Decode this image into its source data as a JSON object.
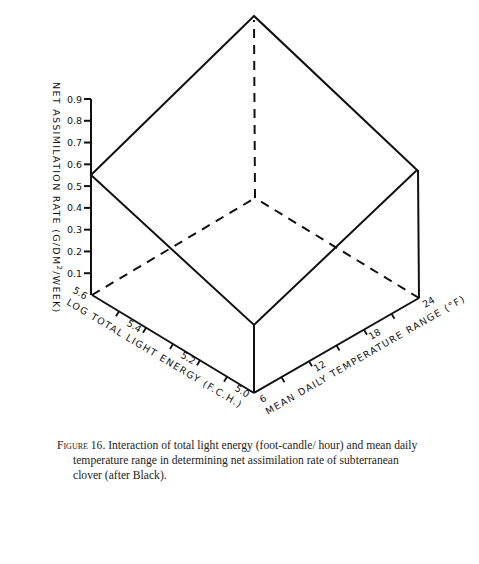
{
  "chart_data": {
    "type": "3d-surface-diagram",
    "title": "",
    "axes": {
      "z": {
        "label": "NET ASSIMILATION RATE (G/DM2/WEEK)",
        "label_parts": [
          "NET ASSIMILATION RATE (G/DM",
          "2",
          "/WEEK)"
        ],
        "ticks": [
          "0.1",
          "0.2",
          "0.3",
          "0.4",
          "0.5",
          "0.6",
          "0.7",
          "0.8",
          "0.9"
        ],
        "range": [
          0,
          0.9
        ]
      },
      "x": {
        "label": "LOG TOTAL LIGHT ENERGY (F.C.H.)",
        "tick_labels": [
          "5.6",
          "5.4",
          "5.2",
          "5.0"
        ],
        "tick_values": [
          5.6,
          5.5,
          5.4,
          5.3,
          5.2,
          5.1,
          5.0
        ],
        "range": [
          5.0,
          5.6
        ]
      },
      "y": {
        "label": "MEAN DAILY TEMPERATURE RANGE (°F)",
        "tick_labels": [
          "6",
          "12",
          "18",
          "24"
        ],
        "tick_values": [
          6,
          9,
          12,
          15,
          18,
          21,
          24
        ],
        "range": [
          6,
          24
        ]
      }
    },
    "surface_corners": [
      {
        "light": 5.6,
        "temp_range": 6,
        "nar": 0.55
      },
      {
        "light": 5.0,
        "temp_range": 6,
        "nar": 0.31
      },
      {
        "light": 5.0,
        "temp_range": 24,
        "nar": 0.59
      },
      {
        "light": 5.6,
        "temp_range": 24,
        "nar": 0.84
      }
    ],
    "grid": false,
    "legend": null
  },
  "caption": {
    "figure_label": "Figure 16.",
    "lines": [
      "Interaction of total light energy (foot-candle/ hour) and mean daily",
      "temperature range in determining net assimilation rate of subterranean",
      "clover (after Black)."
    ]
  },
  "colors": {
    "ink": "#111111",
    "background": "#ffffff"
  }
}
